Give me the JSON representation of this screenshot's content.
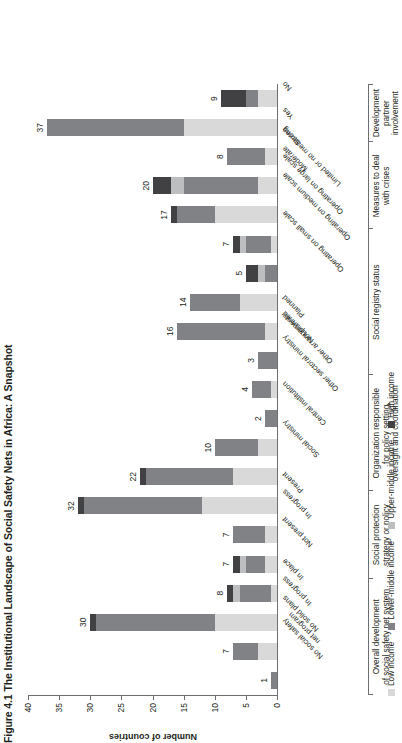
{
  "figure": {
    "caption": "Figure 4.1  The Institutional Landscape of Social Safety Nets in Africa: A Snapshot"
  },
  "legend": {
    "position": "bottom-left",
    "items": [
      {
        "label": "Low income",
        "color": "#d9d9d9"
      },
      {
        "label": "Lower-middle income",
        "color": "#808285"
      },
      {
        "label": "Upper-middle income",
        "color": "#bcbec0"
      },
      {
        "label": "High income",
        "color": "#414042"
      }
    ]
  },
  "chart_data": {
    "type": "bar",
    "subtype": "stacked-bar",
    "orientation": "vertical",
    "title": "The Institutional Landscape of Social Safety Nets in Africa: A Snapshot",
    "xlabel": "",
    "ylabel": "Number of countries",
    "ylim": [
      0,
      40
    ],
    "yticks": [
      0,
      5,
      10,
      15,
      20,
      25,
      30,
      35,
      40
    ],
    "grid": false,
    "categories": [
      "No social safety\nnet program",
      "No solid plans",
      "In progress",
      "In place",
      "Not present",
      "In progress",
      "Present",
      "Social ministry",
      "Central institution",
      "Other sectoral ministry",
      "Other arrangements",
      "Not planned",
      "Planned",
      "Operating on small scale",
      "Operating on medium scale",
      "Operating on large scale",
      "Limited or no measures",
      "Moderate",
      "Strong",
      "Yes",
      "No"
    ],
    "series": [
      {
        "name": "Low income",
        "color": "#d9d9d9",
        "values": [
          0,
          3,
          10,
          1,
          2,
          2,
          12,
          7,
          3,
          0,
          1,
          0,
          2,
          6,
          0,
          1,
          10,
          3,
          2,
          15,
          3
        ]
      },
      {
        "name": "Lower-middle income",
        "color": "#808285",
        "values": [
          1,
          4,
          19,
          5,
          3,
          5,
          19,
          14,
          7,
          2,
          3,
          3,
          14,
          8,
          2,
          4,
          6,
          12,
          6,
          22,
          2
        ]
      },
      {
        "name": "Upper-middle income",
        "color": "#bcbec0",
        "values": [
          0,
          0,
          0,
          1,
          1,
          0,
          0,
          0,
          0,
          0,
          0,
          0,
          0,
          0,
          1,
          1,
          0,
          2,
          0,
          0,
          0
        ]
      },
      {
        "name": "High income",
        "color": "#414042",
        "values": [
          0,
          0,
          1,
          1,
          1,
          0,
          1,
          1,
          0,
          0,
          0,
          0,
          0,
          0,
          2,
          1,
          1,
          3,
          0,
          0,
          4
        ]
      }
    ],
    "totals": [
      1,
      7,
      30,
      8,
      7,
      7,
      32,
      22,
      10,
      2,
      4,
      3,
      16,
      14,
      5,
      7,
      17,
      20,
      8,
      37,
      9
    ],
    "groups": [
      {
        "label": "Overall development\nof social safety net system",
        "start": 0,
        "end": 3
      },
      {
        "label": "Social protection\nstrategy or policy",
        "start": 4,
        "end": 6
      },
      {
        "label": "Organization responsible\nfor policy setting,\noversight and coordination",
        "start": 7,
        "end": 10
      },
      {
        "label": "Social registry status",
        "start": 11,
        "end": 15
      },
      {
        "label": "Measures to deal\nwith crises",
        "start": 16,
        "end": 18
      },
      {
        "label": "Development\npartner\ninvolvement",
        "start": 19,
        "end": 20
      }
    ]
  }
}
